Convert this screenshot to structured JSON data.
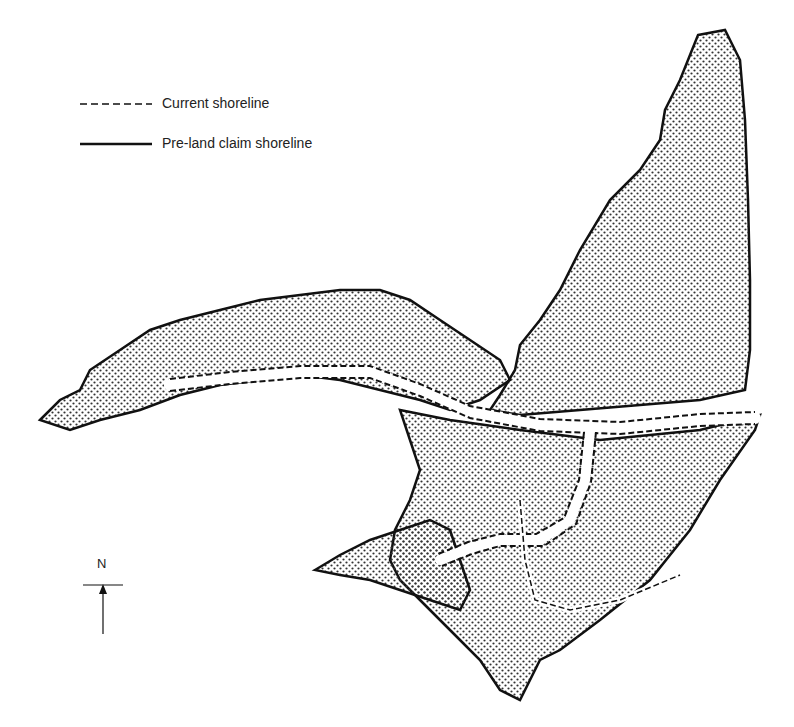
{
  "legend": {
    "items": [
      {
        "label": "Current shoreline",
        "style": "dashed"
      },
      {
        "label": "Pre-land claim shoreline",
        "style": "solid"
      }
    ]
  },
  "north_arrow": {
    "label": "N"
  },
  "colors": {
    "land_dots": "#333333",
    "line": "#111111",
    "background": "#ffffff"
  }
}
